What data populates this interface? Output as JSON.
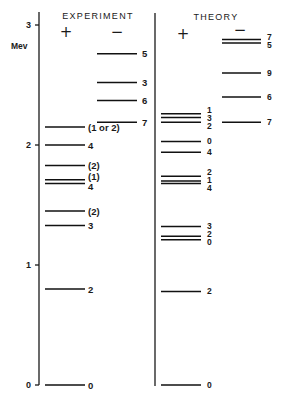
{
  "chart_data": {
    "type": "scatter",
    "title": "",
    "xlabel": "",
    "ylabel": "Mev",
    "ylim": [
      0,
      3
    ],
    "grid": false,
    "legend": "none",
    "yticks": [
      {
        "value": 0,
        "label": "0"
      },
      {
        "value": 1,
        "label": "1"
      },
      {
        "value": 2,
        "label": "2"
      },
      {
        "value": 3,
        "label": "3"
      }
    ],
    "panels": [
      {
        "title": "EXPERIMENT",
        "series": [
          {
            "name": "+",
            "levels": [
              {
                "energy": 0.0,
                "label": "0"
              },
              {
                "energy": 0.8,
                "label": "2"
              },
              {
                "energy": 1.33,
                "label": "3"
              },
              {
                "energy": 1.45,
                "label": "(2)"
              },
              {
                "energy": 1.68,
                "label": "4"
              },
              {
                "energy": 1.71,
                "label": "(1)"
              },
              {
                "energy": 1.83,
                "label": "(2)"
              },
              {
                "energy": 2.0,
                "label": "4"
              },
              {
                "energy": 2.15,
                "label": "(1 or 2)"
              }
            ]
          },
          {
            "name": "−",
            "levels": [
              {
                "energy": 2.19,
                "label": "7"
              },
              {
                "energy": 2.37,
                "label": "6"
              },
              {
                "energy": 2.52,
                "label": "3"
              },
              {
                "energy": 2.76,
                "label": "5"
              }
            ]
          }
        ]
      },
      {
        "title": "THEORY",
        "series": [
          {
            "name": "+",
            "levels": [
              {
                "energy": 0.0,
                "label": "0"
              },
              {
                "energy": 0.78,
                "label": "2"
              },
              {
                "energy": 1.21,
                "label": "0"
              },
              {
                "energy": 1.24,
                "label": "2"
              },
              {
                "energy": 1.32,
                "label": "3"
              },
              {
                "energy": 1.68,
                "label": "4"
              },
              {
                "energy": 1.7,
                "label": "1"
              },
              {
                "energy": 1.74,
                "label": "2"
              },
              {
                "energy": 1.94,
                "label": "4"
              },
              {
                "energy": 2.03,
                "label": "0"
              },
              {
                "energy": 2.19,
                "label": "2"
              },
              {
                "energy": 2.23,
                "label": "3"
              },
              {
                "energy": 2.26,
                "label": "1"
              }
            ]
          },
          {
            "name": "−",
            "levels": [
              {
                "energy": 2.19,
                "label": "7"
              },
              {
                "energy": 2.4,
                "label": "6"
              },
              {
                "energy": 2.6,
                "label": "9"
              },
              {
                "energy": 2.85,
                "label": "5"
              },
              {
                "energy": 2.88,
                "label": "7"
              }
            ]
          }
        ]
      }
    ]
  }
}
